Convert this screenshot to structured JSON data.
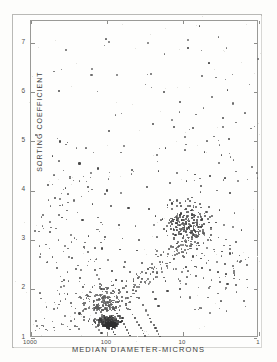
{
  "figure": {
    "background_color": "#fdfdfb",
    "frame_color": "#9a9a97",
    "point_color": "#4a4a4a"
  },
  "chart_data": {
    "type": "scatter",
    "title": "",
    "xlabel": "MEDIAN DIAMETER-MICRONS",
    "ylabel": "SORTING COEFFICIENT",
    "x_scale": "log",
    "x_reversed": true,
    "xlim": [
      1000,
      1
    ],
    "ylim": [
      1,
      7.45
    ],
    "grid": false,
    "legend": null,
    "x_tick_labels": [
      "1000",
      "100",
      "10",
      "1"
    ],
    "x_tick_values": [
      1000,
      100,
      10,
      1
    ],
    "y_tick_labels": [
      "1",
      "2",
      "3",
      "4",
      "5",
      "6",
      "7"
    ],
    "y_tick_values": [
      1,
      2,
      3,
      4,
      5,
      6,
      7
    ],
    "n_points_approx": 900,
    "clusters": [
      {
        "name": "fine-sand dense mode",
        "x_center": 95,
        "y_center": 1.33,
        "note": "very dense core"
      },
      {
        "name": "silt-clay mode",
        "x_center": 9,
        "y_center": 3.35,
        "note": "broad diffuse cloud"
      },
      {
        "name": "coarse tail",
        "x_center": 400,
        "y_center": 2.2,
        "note": "sparse scatter"
      }
    ],
    "points": [
      [
        6.1,
        7.35
      ],
      [
        3.4,
        7.12
      ],
      [
        8.6,
        6.9
      ],
      [
        4.5,
        6.6
      ],
      [
        160,
        6.35
      ],
      [
        73,
        6.35
      ],
      [
        5.6,
        6.33
      ],
      [
        2.6,
        6.05
      ],
      [
        430,
        6.03
      ],
      [
        18,
        6.0
      ],
      [
        11,
        5.8
      ],
      [
        2.2,
        5.77
      ],
      [
        6.8,
        5.55
      ],
      [
        3.0,
        5.48
      ],
      [
        25,
        5.35
      ],
      [
        13,
        5.3
      ],
      [
        7.4,
        5.28
      ],
      [
        3.9,
        5.1
      ],
      [
        2.5,
        5.05
      ],
      [
        420,
        5.0
      ],
      [
        330,
        4.98
      ],
      [
        95,
        5.22
      ],
      [
        60,
        4.9
      ],
      [
        17,
        4.86
      ],
      [
        9.5,
        4.82
      ],
      [
        5.2,
        4.78
      ],
      [
        3.1,
        4.72
      ],
      [
        520,
        4.7
      ],
      [
        230,
        4.55
      ],
      [
        130,
        4.45
      ],
      [
        47,
        4.42
      ],
      [
        21,
        4.4
      ],
      [
        12,
        4.36
      ],
      [
        7.0,
        4.33
      ],
      [
        4.4,
        4.3
      ],
      [
        2.8,
        4.25
      ],
      [
        1.9,
        4.2
      ],
      [
        600,
        4.12
      ],
      [
        350,
        4.05
      ],
      [
        180,
        4.07
      ],
      [
        100,
        4.0
      ],
      [
        66,
        3.95
      ],
      [
        30,
        4.08
      ],
      [
        15,
        4.15
      ],
      [
        9.0,
        4.2
      ],
      [
        5.8,
        4.1
      ],
      [
        3.6,
        4.0
      ],
      [
        2.4,
        3.95
      ],
      [
        480,
        3.85
      ],
      [
        270,
        3.8
      ],
      [
        155,
        3.72
      ],
      [
        88,
        3.68
      ],
      [
        52,
        3.65
      ],
      [
        28,
        3.62
      ],
      [
        16,
        3.7
      ],
      [
        11,
        3.75
      ],
      [
        8.0,
        3.78
      ],
      [
        6.0,
        3.72
      ],
      [
        4.6,
        3.66
      ],
      [
        3.3,
        3.6
      ],
      [
        2.1,
        3.55
      ],
      [
        700,
        3.5
      ],
      [
        390,
        3.45
      ],
      [
        210,
        3.4
      ],
      [
        120,
        3.35
      ],
      [
        70,
        3.3
      ],
      [
        42,
        3.28
      ],
      [
        24,
        3.3
      ],
      [
        14,
        3.38
      ],
      [
        10,
        3.45
      ],
      [
        7.6,
        3.5
      ],
      [
        5.9,
        3.48
      ],
      [
        4.7,
        3.42
      ],
      [
        3.7,
        3.35
      ],
      [
        2.9,
        3.3
      ],
      [
        2.2,
        3.25
      ],
      [
        1.7,
        3.2
      ],
      [
        560,
        3.15
      ],
      [
        300,
        3.1
      ],
      [
        175,
        3.08
      ],
      [
        105,
        3.05
      ],
      [
        62,
        3.02
      ],
      [
        38,
        3.0
      ],
      [
        22,
        3.05
      ],
      [
        13.5,
        3.12
      ],
      [
        9.8,
        3.18
      ],
      [
        7.2,
        3.2
      ],
      [
        5.5,
        3.15
      ],
      [
        4.3,
        3.1
      ],
      [
        3.4,
        3.05
      ],
      [
        2.7,
        3.0
      ],
      [
        2.0,
        2.95
      ],
      [
        640,
        2.9
      ],
      [
        360,
        2.88
      ],
      [
        200,
        2.85
      ],
      [
        115,
        2.82
      ],
      [
        68,
        2.8
      ],
      [
        40,
        2.78
      ],
      [
        23,
        2.8
      ],
      [
        14.5,
        2.86
      ],
      [
        10.5,
        2.9
      ],
      [
        7.8,
        2.92
      ],
      [
        6.2,
        2.88
      ],
      [
        4.9,
        2.84
      ],
      [
        3.9,
        2.8
      ],
      [
        3.1,
        2.76
      ],
      [
        2.4,
        2.72
      ],
      [
        1.8,
        2.68
      ],
      [
        520,
        2.65
      ],
      [
        290,
        2.62
      ],
      [
        165,
        2.6
      ],
      [
        98,
        2.58
      ],
      [
        58,
        2.55
      ],
      [
        35,
        2.52
      ],
      [
        20,
        2.55
      ],
      [
        13,
        2.6
      ],
      [
        9.6,
        2.64
      ],
      [
        7.4,
        2.66
      ],
      [
        5.8,
        2.62
      ],
      [
        4.6,
        2.58
      ],
      [
        3.6,
        2.54
      ],
      [
        2.8,
        2.5
      ],
      [
        2.2,
        2.46
      ],
      [
        460,
        2.42
      ],
      [
        255,
        2.4
      ],
      [
        145,
        2.38
      ],
      [
        86,
        2.36
      ],
      [
        50,
        2.34
      ],
      [
        31,
        2.32
      ],
      [
        19,
        2.35
      ],
      [
        12.5,
        2.4
      ],
      [
        9.2,
        2.44
      ],
      [
        7.0,
        2.46
      ],
      [
        5.6,
        2.42
      ],
      [
        4.4,
        2.38
      ],
      [
        3.5,
        2.34
      ],
      [
        2.7,
        2.3
      ],
      [
        2.1,
        2.28
      ],
      [
        410,
        2.25
      ],
      [
        225,
        2.22
      ],
      [
        128,
        2.2
      ],
      [
        76,
        2.18
      ],
      [
        45,
        2.16
      ],
      [
        27,
        2.14
      ],
      [
        17,
        2.16
      ],
      [
        11.5,
        2.2
      ],
      [
        8.8,
        2.24
      ],
      [
        6.8,
        2.26
      ],
      [
        5.4,
        2.22
      ],
      [
        4.2,
        2.18
      ],
      [
        3.3,
        2.14
      ],
      [
        2.6,
        2.1
      ],
      [
        2.0,
        2.08
      ],
      [
        370,
        2.05
      ],
      [
        205,
        2.03
      ],
      [
        118,
        2.0
      ],
      [
        70,
        1.98
      ],
      [
        42,
        1.96
      ],
      [
        25,
        1.94
      ],
      [
        16,
        1.96
      ],
      [
        11,
        2.0
      ],
      [
        330,
        1.9
      ],
      [
        185,
        1.88
      ],
      [
        108,
        1.86
      ],
      [
        64,
        1.84
      ],
      [
        38,
        1.82
      ],
      [
        23,
        1.8
      ],
      [
        150,
        1.75
      ],
      [
        92,
        1.72
      ],
      [
        56,
        1.7
      ],
      [
        34,
        1.68
      ],
      [
        21,
        1.66
      ],
      [
        300,
        1.72
      ],
      [
        135,
        1.62
      ],
      [
        82,
        1.6
      ],
      [
        50,
        1.58
      ],
      [
        31,
        1.56
      ],
      [
        260,
        1.6
      ],
      [
        120,
        1.52
      ],
      [
        74,
        1.5
      ],
      [
        46,
        1.48
      ],
      [
        29,
        1.47
      ],
      [
        230,
        1.5
      ],
      [
        110,
        1.44
      ],
      [
        68,
        1.42
      ],
      [
        43,
        1.41
      ],
      [
        27,
        1.4
      ],
      [
        200,
        1.42
      ],
      [
        100,
        1.36
      ],
      [
        63,
        1.34
      ],
      [
        40,
        1.33
      ],
      [
        26,
        1.32
      ],
      [
        175,
        1.35
      ],
      [
        95,
        1.3
      ],
      [
        60,
        1.28
      ],
      [
        38,
        1.27
      ],
      [
        24,
        1.26
      ],
      [
        155,
        1.28
      ],
      [
        90,
        1.24
      ],
      [
        57,
        1.22
      ],
      [
        36,
        1.21
      ],
      [
        23,
        1.2
      ],
      [
        140,
        1.22
      ],
      [
        86,
        1.18
      ],
      [
        55,
        1.16
      ],
      [
        34,
        1.15
      ],
      [
        22,
        1.14
      ],
      [
        128,
        1.16
      ],
      [
        82,
        1.12
      ],
      [
        52,
        1.1
      ],
      [
        33,
        1.09
      ],
      [
        21,
        1.08
      ],
      [
        118,
        1.1
      ],
      [
        78,
        1.07
      ],
      [
        50,
        1.05
      ],
      [
        32,
        1.04
      ],
      [
        20,
        1.03
      ]
    ]
  },
  "axes": {
    "y_title": "SORTING COEFFICIENT",
    "x_title": "MEDIAN DIAMETER-MICRONS"
  }
}
